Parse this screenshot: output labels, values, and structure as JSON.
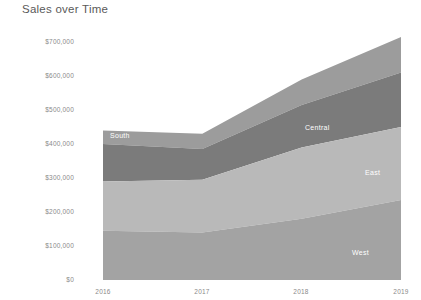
{
  "chart_data": {
    "type": "area",
    "stacked": true,
    "title": "Sales over Time",
    "xlabel": "",
    "ylabel": "",
    "x": [
      2016,
      2017,
      2018,
      2019
    ],
    "x_tick_labels": [
      "2016",
      "2017",
      "2018",
      "2019"
    ],
    "y_tick_labels": [
      "$700,000",
      "$600,000",
      "$500,000",
      "$400,000",
      "$300,000",
      "$200,000",
      "$100,000",
      "$0"
    ],
    "y_tick_values": [
      700000,
      600000,
      500000,
      400000,
      300000,
      200000,
      100000,
      0
    ],
    "ylim": [
      0,
      735000
    ],
    "xlim": [
      2016,
      2019
    ],
    "grid": false,
    "legend_position": "inline-labels",
    "series": [
      {
        "name": "West",
        "label": "West",
        "color": "#a3a3a3",
        "values": [
          145000,
          140000,
          180000,
          235000
        ]
      },
      {
        "name": "East",
        "label": "East",
        "color": "#b9b9b9",
        "values": [
          145000,
          155000,
          210000,
          215000
        ]
      },
      {
        "name": "Central",
        "label": "Central",
        "color": "#7b7b7b",
        "values": [
          110000,
          90000,
          125000,
          160000
        ]
      },
      {
        "name": "South",
        "label": "South",
        "color": "#9c9c9c",
        "values": [
          40000,
          45000,
          75000,
          105000
        ]
      }
    ],
    "cumulative_tops": {
      "West": [
        145000,
        140000,
        180000,
        235000
      ],
      "East": [
        290000,
        295000,
        390000,
        450000
      ],
      "Central": [
        400000,
        385000,
        515000,
        610000
      ],
      "South": [
        440000,
        430000,
        590000,
        715000
      ]
    }
  },
  "labels": {
    "south": "South",
    "central": "Central",
    "east": "East",
    "west": "West"
  }
}
